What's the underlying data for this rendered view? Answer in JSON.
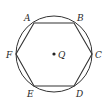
{
  "diagram": {
    "circle": {
      "cx": 54,
      "cy": 54,
      "r": 38,
      "stroke": "#333333"
    },
    "center": {
      "label": "Q",
      "x": 54,
      "y": 54
    },
    "hexagon": {
      "stroke": "#333333",
      "vertices": [
        {
          "label": "A",
          "x": 34,
          "y": 23
        },
        {
          "label": "B",
          "x": 74,
          "y": 23
        },
        {
          "label": "C",
          "x": 92,
          "y": 54
        },
        {
          "label": "D",
          "x": 74,
          "y": 86
        },
        {
          "label": "E",
          "x": 34,
          "y": 86
        },
        {
          "label": "F",
          "x": 16,
          "y": 54
        }
      ]
    },
    "labels": {
      "A": "A",
      "B": "B",
      "C": "C",
      "D": "D",
      "E": "E",
      "F": "F",
      "Q": "Q"
    }
  }
}
